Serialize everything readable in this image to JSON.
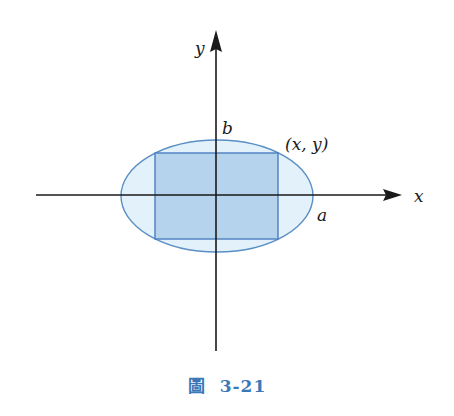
{
  "diagram": {
    "type": "ellipse-inscribed-rectangle",
    "axes": {
      "x_label": "x",
      "y_label": "y",
      "origin": [
        216,
        195
      ],
      "x_range_px": [
        36,
        400
      ],
      "y_range_px": [
        30,
        351
      ]
    },
    "ellipse": {
      "cx": 217,
      "cy": 196,
      "rx": 96,
      "ry": 56,
      "fill": "#e3f1fa",
      "stroke": "#5b8fc4"
    },
    "rectangle": {
      "x": 155,
      "y": 153,
      "width": 123,
      "height": 86,
      "fill": "#b5d3ec",
      "stroke": "#4a7fbf"
    },
    "labels": {
      "b": "b",
      "a": "a",
      "point": "(x, y)"
    },
    "colors": {
      "axis": "#1a1a1a",
      "accent": "#3b78b8"
    }
  },
  "caption": {
    "prefix": "圖",
    "number": "3-21"
  }
}
